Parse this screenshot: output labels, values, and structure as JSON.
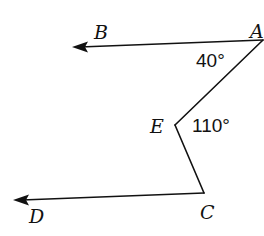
{
  "diagram": {
    "type": "geometry",
    "points": {
      "A": {
        "label": "A",
        "x": 263,
        "y": 40,
        "label_x": 250,
        "label_y": 38
      },
      "B": {
        "label": "B",
        "x": 73,
        "y": 47,
        "label_x": 94,
        "label_y": 39
      },
      "E": {
        "label": "E",
        "x": 175,
        "y": 125,
        "label_x": 150,
        "label_y": 133
      },
      "C": {
        "label": "C",
        "x": 204,
        "y": 193,
        "label_x": 200,
        "label_y": 219
      },
      "D": {
        "label": "D",
        "x": 14,
        "y": 200,
        "label_x": 29,
        "label_y": 223
      }
    },
    "angles": [
      {
        "name": "angle-BAE",
        "label": "40°",
        "x": 196,
        "y": 67
      },
      {
        "name": "angle-AEC",
        "label": "110°",
        "x": 192,
        "y": 132
      }
    ],
    "rays": [
      {
        "from": "A",
        "toward": "B"
      },
      {
        "from": "C",
        "toward": "D"
      }
    ],
    "segments": [
      {
        "from": "A",
        "to": "E"
      },
      {
        "from": "E",
        "to": "C"
      }
    ],
    "colors": {
      "stroke": "#111111",
      "background": "#ffffff"
    }
  }
}
